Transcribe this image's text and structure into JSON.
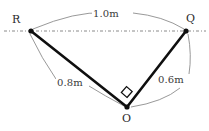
{
  "figure": {
    "type": "geometry-diagram",
    "background_color": "#ffffff",
    "line_color": "#111111",
    "arc_color": "#808080",
    "axis_line_color": "#888888",
    "vertices": [
      {
        "id": "R",
        "label": "R",
        "x": 31,
        "y": 31
      },
      {
        "id": "Q",
        "label": "Q",
        "x": 186,
        "y": 31
      },
      {
        "id": "O",
        "label": "O",
        "x": 127,
        "y": 107
      }
    ],
    "sides": [
      {
        "id": "RQ",
        "from": "R",
        "to": "Q",
        "label": "1.0m",
        "value": 1.0,
        "unit": "m"
      },
      {
        "id": "RO",
        "from": "R",
        "to": "O",
        "label": "0.8m",
        "value": 0.8,
        "unit": "m"
      },
      {
        "id": "QO",
        "from": "Q",
        "to": "O",
        "label": "0.6m",
        "value": 0.6,
        "unit": "m"
      }
    ],
    "right_angle": {
      "at": "O",
      "marker": "square"
    },
    "reference_line": {
      "style": "dash-dot",
      "orientation": "horizontal",
      "y": 31
    }
  }
}
